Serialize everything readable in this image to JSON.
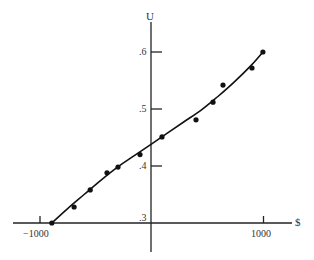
{
  "chart_data": {
    "type": "scatter",
    "title": "",
    "xlabel": "$",
    "ylabel": "U",
    "xlim": [
      -1200,
      1250
    ],
    "ylim": [
      0.3,
      0.65
    ],
    "grid": false,
    "legend": null,
    "x_ticks": [
      {
        "value": -1000,
        "label": "−1000"
      },
      {
        "value": 1000,
        "label": "1000"
      }
    ],
    "y_ticks": [
      {
        "value": 0.3,
        "label": ".3"
      },
      {
        "value": 0.4,
        "label": ".4"
      },
      {
        "value": 0.5,
        "label": ".5"
      },
      {
        "value": 0.6,
        "label": ".6"
      }
    ],
    "series": [
      {
        "name": "observed points",
        "kind": "scatter",
        "points": [
          {
            "x": -890,
            "y": 0.3
          },
          {
            "x": -690,
            "y": 0.328
          },
          {
            "x": -545,
            "y": 0.358
          },
          {
            "x": -395,
            "y": 0.388
          },
          {
            "x": -296,
            "y": 0.398
          },
          {
            "x": -99,
            "y": 0.42
          },
          {
            "x": 99,
            "y": 0.451
          },
          {
            "x": 404,
            "y": 0.481
          },
          {
            "x": 556,
            "y": 0.512
          },
          {
            "x": 646,
            "y": 0.542
          },
          {
            "x": 906,
            "y": 0.572
          },
          {
            "x": 1004,
            "y": 0.6
          }
        ]
      },
      {
        "name": "fitted utility curve",
        "kind": "line",
        "points": [
          {
            "x": -890,
            "y": 0.3
          },
          {
            "x": -750,
            "y": 0.325
          },
          {
            "x": -600,
            "y": 0.35
          },
          {
            "x": -450,
            "y": 0.375
          },
          {
            "x": -300,
            "y": 0.398
          },
          {
            "x": -150,
            "y": 0.418
          },
          {
            "x": 0,
            "y": 0.438
          },
          {
            "x": 150,
            "y": 0.458
          },
          {
            "x": 300,
            "y": 0.478
          },
          {
            "x": 450,
            "y": 0.498
          },
          {
            "x": 600,
            "y": 0.522
          },
          {
            "x": 750,
            "y": 0.548
          },
          {
            "x": 900,
            "y": 0.577
          },
          {
            "x": 1004,
            "y": 0.6
          }
        ]
      }
    ]
  },
  "labels": {
    "y_axis": "U",
    "x_axis": "$",
    "x_tick_neg": "−1000",
    "x_tick_pos": "1000",
    "y_tick_3": ".3",
    "y_tick_4": ".4",
    "y_tick_5": ".5",
    "y_tick_6": ".6"
  }
}
